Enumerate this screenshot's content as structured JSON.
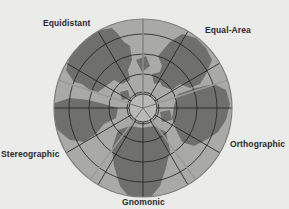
{
  "diagram": {
    "labels": {
      "equidistant": "Equidistant",
      "equal_area": "Equal-Area",
      "stereographic": "Stereographic",
      "orthographic": "Orthographic",
      "gnomonic": "Gnomonic"
    },
    "colors": {
      "background": "#ebebea",
      "ocean": "#a9a9a8",
      "land": "#6f6f6e",
      "lines": "#1e1e1e",
      "rim": "#8a8a8a",
      "polar_cap": "#b8b8b6"
    },
    "geometry": {
      "center": [
        143,
        108
      ],
      "radius": 89
    }
  }
}
